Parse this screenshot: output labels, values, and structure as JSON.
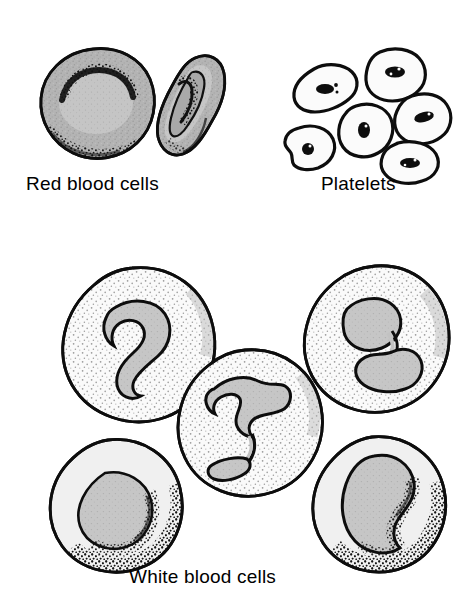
{
  "figure": {
    "title": "Blood cells",
    "background_color": "#ffffff",
    "width": 467,
    "height": 604
  },
  "palette": {
    "outline": "#0d0d0d",
    "rbc_fill": "#b0b0b0",
    "rbc_inner": "#c4c4c4",
    "wbc_cytoplasm": "#f4f4f4",
    "wbc_nucleus": "#c2c2c2",
    "platelet_fill": "#fbfbfb",
    "platelet_granule": "#0d0d0d",
    "caption_color": "#000000"
  },
  "groups": [
    {
      "id": "red-blood-cells",
      "caption": "Red blood cells",
      "count": 2,
      "cells": [
        {
          "name": "erythrocyte-face-view",
          "view": "face-on",
          "shape": "biconcave disc",
          "has_nucleus": false,
          "feature": "central pale depression with dark crescent shading"
        },
        {
          "name": "erythrocyte-edge-view",
          "view": "tilted edge",
          "shape": "biconcave disc",
          "has_nucleus": false,
          "feature": "dumbbell profile with central pinch"
        }
      ]
    },
    {
      "id": "platelets",
      "caption": "Platelets",
      "count": 6,
      "cells": [
        {
          "name": "platelet-1",
          "shape": "irregular blob",
          "granule": true
        },
        {
          "name": "platelet-2",
          "shape": "irregular blob",
          "granule": true
        },
        {
          "name": "platelet-3",
          "shape": "irregular blob",
          "granule": true
        },
        {
          "name": "platelet-4",
          "shape": "irregular blob",
          "granule": true
        },
        {
          "name": "platelet-5",
          "shape": "irregular blob",
          "granule": true
        },
        {
          "name": "platelet-6",
          "shape": "irregular blob",
          "granule": true
        }
      ]
    },
    {
      "id": "white-blood-cells",
      "caption": "White blood cells",
      "count": 5,
      "cells": [
        {
          "name": "neutrophil-c-shaped",
          "position": "top-left",
          "nucleus": "C-shaped lobed",
          "cytoplasm": "finely stippled"
        },
        {
          "name": "neutrophil-s-shaped",
          "position": "top-right",
          "nucleus": "S-shaped lobed",
          "cytoplasm": "finely stippled"
        },
        {
          "name": "neutrophil-multilobed",
          "position": "center",
          "nucleus": "multi-lobed with thin strands",
          "cytoplasm": "finely stippled"
        },
        {
          "name": "lymphocyte",
          "position": "bottom-left",
          "nucleus": "large round",
          "cytoplasm": "thin rim, stipple shaded"
        },
        {
          "name": "monocyte",
          "position": "bottom-right",
          "nucleus": "kidney/bean shaped",
          "cytoplasm": "abundant, stipple shaded"
        }
      ]
    }
  ],
  "captions": {
    "red_blood_cells": "Red blood cells",
    "platelets": "Platelets",
    "white_blood_cells": "White blood cells"
  }
}
